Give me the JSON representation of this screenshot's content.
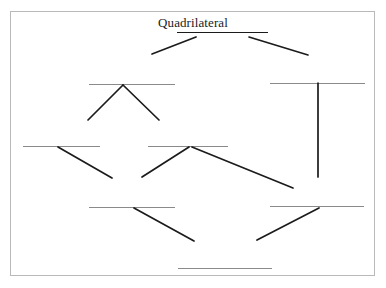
{
  "page": {
    "background_color": "#ffffff",
    "frame_color": "#b9b9b9",
    "line_color": "#1b1b1b",
    "blank_color": "#8a8a8a"
  },
  "diagram": {
    "type": "hierarchy-tree",
    "root_label": "Quadrilateral",
    "node_count": 8,
    "labeled_node_count": 1,
    "blank_node_count": 7,
    "nodes": [
      {
        "id": "root",
        "name": "root-node",
        "label": "Quadrilateral",
        "is_blank": false,
        "level": 0,
        "line": {
          "x1": 177,
          "y1": 32,
          "x2": 268,
          "y2": 32
        }
      },
      {
        "id": "n-l1",
        "name": "level1-left-node",
        "label": "",
        "is_blank": true,
        "level": 1,
        "line": {
          "x1": 89,
          "y1": 84,
          "x2": 175,
          "y2": 84
        }
      },
      {
        "id": "n-r1",
        "name": "level1-right-node",
        "label": "",
        "is_blank": true,
        "level": 1,
        "line": {
          "x1": 270,
          "y1": 83,
          "x2": 365,
          "y2": 83
        }
      },
      {
        "id": "n-l2",
        "name": "level2-left-node",
        "label": "",
        "is_blank": true,
        "level": 2,
        "line": {
          "x1": 23,
          "y1": 146,
          "x2": 100,
          "y2": 146
        }
      },
      {
        "id": "n-c2",
        "name": "level2-center-node",
        "label": "",
        "is_blank": true,
        "level": 2,
        "line": {
          "x1": 148,
          "y1": 146,
          "x2": 228,
          "y2": 146
        }
      },
      {
        "id": "n-l3",
        "name": "level3-left-node",
        "label": "",
        "is_blank": true,
        "level": 3,
        "line": {
          "x1": 89,
          "y1": 207,
          "x2": 175,
          "y2": 207
        }
      },
      {
        "id": "n-r3",
        "name": "level3-right-node",
        "label": "",
        "is_blank": true,
        "level": 3,
        "line": {
          "x1": 270,
          "y1": 206,
          "x2": 364,
          "y2": 206
        }
      },
      {
        "id": "n-b4",
        "name": "level4-bottom-node",
        "label": "",
        "is_blank": true,
        "level": 4,
        "line": {
          "x1": 178,
          "y1": 268,
          "x2": 272,
          "y2": 268
        }
      }
    ],
    "connectors": [
      {
        "id": "c1",
        "name": "connector-root-to-left",
        "from": "root",
        "to": "n-l1",
        "x1": 196,
        "y1": 37,
        "x2": 152,
        "y2": 54
      },
      {
        "id": "c2",
        "name": "connector-root-to-right",
        "from": "root",
        "to": "n-r1",
        "x1": 249,
        "y1": 37,
        "x2": 308,
        "y2": 55
      },
      {
        "id": "c3",
        "name": "connector-left1-to-left2",
        "from": "n-l1",
        "to": "n-l2",
        "x1": 123,
        "y1": 85,
        "x2": 88,
        "y2": 120
      },
      {
        "id": "c4",
        "name": "connector-left1-to-center2",
        "from": "n-l1",
        "to": "n-c2",
        "x1": 123,
        "y1": 85,
        "x2": 159,
        "y2": 120
      },
      {
        "id": "c5",
        "name": "connector-right1-vertical",
        "from": "n-r1",
        "to": "n-r3",
        "x1": 318,
        "y1": 83,
        "x2": 318,
        "y2": 177
      },
      {
        "id": "c6",
        "name": "connector-left2-to-left3",
        "from": "n-l2",
        "to": "n-l3",
        "x1": 58,
        "y1": 147,
        "x2": 112,
        "y2": 178
      },
      {
        "id": "c7",
        "name": "connector-center2-to-left3",
        "from": "n-c2",
        "to": "n-l3",
        "x1": 189,
        "y1": 147,
        "x2": 142,
        "y2": 177
      },
      {
        "id": "c8",
        "name": "connector-center2-to-right3",
        "from": "n-c2",
        "to": "n-r3",
        "x1": 192,
        "y1": 147,
        "x2": 293,
        "y2": 188
      },
      {
        "id": "c9",
        "name": "connector-left3-to-bottom",
        "from": "n-l3",
        "to": "n-b4",
        "x1": 134,
        "y1": 208,
        "x2": 194,
        "y2": 241
      },
      {
        "id": "c10",
        "name": "connector-right3-to-bottom",
        "from": "n-r3",
        "to": "n-b4",
        "x1": 319,
        "y1": 208,
        "x2": 257,
        "y2": 240
      }
    ]
  }
}
